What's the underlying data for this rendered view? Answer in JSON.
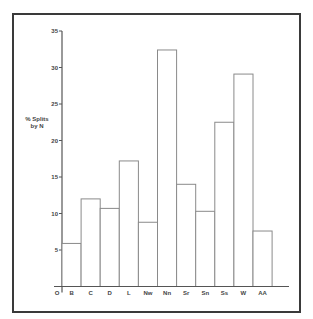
{
  "chart_data": {
    "type": "bar",
    "title": "",
    "xlabel": "",
    "ylabel": "% Splits by N",
    "ylabel_lines": [
      "% Splits",
      "by N"
    ],
    "origin_label": "O",
    "categories": [
      "B",
      "C",
      "D",
      "L",
      "Nw",
      "Nn",
      "Sr",
      "Sn",
      "Ss",
      "W",
      "AA"
    ],
    "values": [
      5.9,
      12.0,
      10.7,
      17.2,
      8.8,
      32.4,
      14.0,
      10.3,
      22.5,
      29.1,
      7.6
    ],
    "ylim": [
      0,
      35
    ],
    "yticks": [
      5,
      10,
      15,
      20,
      25,
      30,
      35
    ],
    "grid": false,
    "legend": null,
    "colors": {
      "bar_fill": "#ffffff",
      "bar_stroke": "#8a8a8a",
      "axis": "#555555",
      "frame": "#3a3a3a"
    }
  }
}
